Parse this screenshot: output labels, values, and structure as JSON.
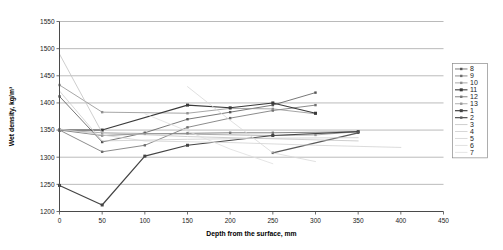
{
  "chart_data": {
    "type": "line",
    "title": "",
    "xlabel": "Depth from the surface, mm",
    "ylabel": "Wet density, kg/m³",
    "xlim": [
      0,
      450
    ],
    "ylim": [
      1200,
      1550
    ],
    "xticks": [
      0,
      50,
      100,
      150,
      200,
      250,
      300,
      350,
      400,
      450
    ],
    "yticks": [
      1200,
      1250,
      1300,
      1350,
      1400,
      1450,
      1500,
      1550
    ],
    "grid": "horizontal",
    "legend_position": "right-outside",
    "legend_entries": [
      "8",
      "9",
      "10",
      "11",
      "12",
      "13",
      "1",
      "2",
      "3",
      "4",
      "5",
      "6",
      "7"
    ],
    "series": [
      {
        "name": "8",
        "color": "#555555",
        "width": 0.8,
        "marker": "dot",
        "x": [
          0,
          50,
          100,
          150,
          200,
          250,
          300
        ],
        "y": [
          1412,
          1328,
          1345,
          1370,
          1383,
          1396,
          1419
        ]
      },
      {
        "name": "9",
        "color": "#6e6e6e",
        "width": 0.8,
        "marker": "dot",
        "x": [
          0,
          50,
          100,
          150,
          200,
          250,
          300
        ],
        "y": [
          1350,
          1310,
          1322,
          1355,
          1372,
          1386,
          1396
        ]
      },
      {
        "name": "10",
        "color": "#8f8f8f",
        "width": 0.8,
        "marker": "dot",
        "x": [
          0,
          50,
          150,
          200,
          250,
          300
        ],
        "y": [
          1433,
          1383,
          1381,
          1390,
          1389,
          1380
        ]
      },
      {
        "name": "11",
        "color": "#3a3a3a",
        "width": 1.1,
        "marker": "square",
        "x": [
          0,
          50,
          150,
          200,
          250,
          300
        ],
        "y": [
          1350,
          1350,
          1396,
          1391,
          1400,
          1381
        ]
      },
      {
        "name": "12",
        "color": "#777777",
        "width": 0.9,
        "marker": "dot",
        "x": [
          0,
          50,
          100,
          150,
          200,
          250,
          350
        ],
        "y": [
          1350,
          1340,
          1343,
          1344,
          1345,
          1345,
          1347
        ]
      },
      {
        "name": "13",
        "color": "#9a9a9a",
        "width": 0.8,
        "marker": "dot",
        "x": [
          0,
          50,
          250,
          300,
          350
        ],
        "y": [
          1350,
          1345,
          1340,
          1341,
          1347
        ]
      },
      {
        "name": "1",
        "color": "#444444",
        "width": 1.2,
        "marker": "square",
        "x": [
          0,
          50,
          100,
          150,
          250,
          350
        ],
        "y": [
          1248,
          1212,
          1302,
          1322,
          1340,
          1347
        ]
      },
      {
        "name": "2",
        "color": "#5a5a5a",
        "width": 1.3,
        "marker": "dot",
        "x": [
          250,
          350
        ],
        "y": [
          1308,
          1345
        ]
      },
      {
        "name": "3",
        "color": "#c2c2c2",
        "width": 0.8,
        "marker": "none",
        "x": [
          0,
          50,
          150,
          250,
          350
        ],
        "y": [
          1490,
          1345,
          1338,
          1334,
          1330
        ]
      },
      {
        "name": "4",
        "color": "#cccccc",
        "width": 0.8,
        "marker": "none",
        "x": [
          0,
          50,
          150,
          250,
          350
        ],
        "y": [
          1422,
          1330,
          1333,
          1335,
          1336
        ]
      },
      {
        "name": "5",
        "color": "#d2d2d2",
        "width": 0.8,
        "marker": "none",
        "x": [
          0,
          100,
          200,
          300,
          400
        ],
        "y": [
          1352,
          1330,
          1327,
          1322,
          1318
        ]
      },
      {
        "name": "6",
        "color": "#d8d8d8",
        "width": 0.8,
        "marker": "none",
        "x": [
          150,
          200,
          250,
          300
        ],
        "y": [
          1430,
          1368,
          1308,
          1292
        ]
      },
      {
        "name": "7",
        "color": "#dedede",
        "width": 0.8,
        "marker": "none",
        "x": [
          100,
          150,
          200,
          250
        ],
        "y": [
          1380,
          1348,
          1315,
          1288
        ]
      }
    ]
  },
  "legend": {
    "entries": [
      "8",
      "9",
      "10",
      "11",
      "12",
      "13",
      "1",
      "2",
      "3",
      "4",
      "5",
      "6",
      "7"
    ]
  },
  "axes": {
    "x_title": "Depth from the surface, mm",
    "y_title": "Wet density, kg/m³"
  }
}
